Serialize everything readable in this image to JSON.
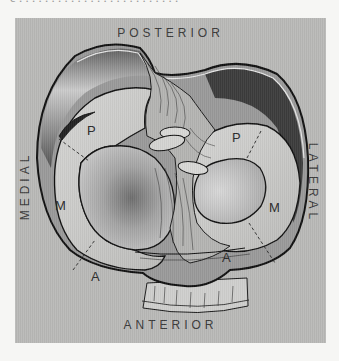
{
  "figure": {
    "orientation_labels": {
      "top": "POSTERIOR",
      "bottom": "ANTERIOR",
      "left": "MEDIAL",
      "right": "LATERAL"
    },
    "medial_meniscus": {
      "regions": [
        "P",
        "M",
        "A"
      ]
    },
    "lateral_meniscus": {
      "regions": [
        "P",
        "M",
        "A"
      ]
    },
    "colors": {
      "background": "#b9b9b7",
      "outline": "#1a1a1a",
      "posterior_shadow": "#3c3c3c",
      "meniscus_fill": "#c8c8c6"
    }
  }
}
